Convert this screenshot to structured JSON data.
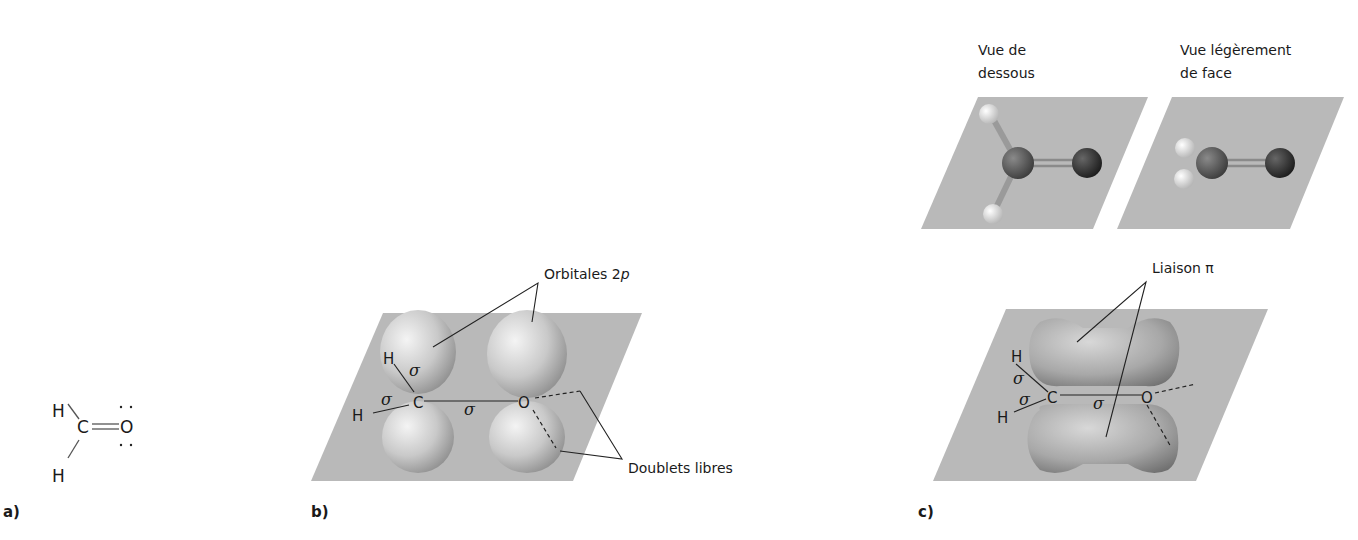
{
  "figure": {
    "panel_a": {
      "label": "a)",
      "atoms": {
        "h_top": "H",
        "h_bottom": "H",
        "carbon": "C",
        "oxygen": "O"
      },
      "lone_pairs": ":"
    },
    "panel_b": {
      "label": "b)",
      "orbitals_label": "Orbitales 2",
      "orbitals_label_italic": "p",
      "lone_pairs_label": "Doublets libres",
      "atoms": {
        "h_top": "H",
        "h_left": "H",
        "carbon": "C",
        "oxygen": "O"
      },
      "sigma": "σ"
    },
    "panel_c": {
      "label": "c)",
      "view_below_line1": "Vue de",
      "view_below_line2": "dessous",
      "view_front_line1": "Vue légèrement",
      "view_front_line2": "de face",
      "pi_bond_label": "Liaison π",
      "atoms": {
        "h_top": "H",
        "h_left": "H",
        "carbon": "C",
        "oxygen": "O"
      },
      "sigma": "σ"
    }
  },
  "colors": {
    "plane": "#b9b9b9",
    "lobe": "#c4c4c4",
    "carbon_ball": "#5a5a5a",
    "oxygen_ball": "#2e2e2e",
    "hydrogen_ball": "#efefef"
  }
}
